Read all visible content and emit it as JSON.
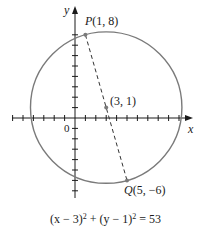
{
  "diagram": {
    "type": "circle-on-coordinate-plane",
    "axes": {
      "x_label": "x",
      "y_label": "y",
      "origin_label": "0",
      "x_ticks": [
        -6,
        -5,
        -4,
        -3,
        -2,
        -1,
        1,
        2,
        3,
        4,
        5,
        6,
        7,
        8,
        9,
        10,
        11
      ],
      "y_ticks": [
        -7,
        -6,
        -5,
        -4,
        -3,
        -2,
        -1,
        1,
        2,
        3,
        4,
        5,
        6,
        7,
        8
      ]
    },
    "circle": {
      "center": [
        3,
        1
      ],
      "radius_squared": 53,
      "stroke_color": "#7a7a7a"
    },
    "points": [
      {
        "name": "P",
        "coords_label": "(1, 8)",
        "x": 1,
        "y": 8
      },
      {
        "name": "center",
        "coords_label": "(3, 1)",
        "x": 3,
        "y": 1
      },
      {
        "name": "Q",
        "coords_label": "(5, −6)",
        "x": 5,
        "y": -6
      }
    ],
    "segment": {
      "from": "P",
      "to": "Q",
      "style": "dashed"
    },
    "equation": {
      "lhs_a": "(x − 3)",
      "exp_a": "2",
      "plus": " + ",
      "lhs_b": "(y − 1)",
      "exp_b": "2",
      "rhs": " = 53"
    }
  },
  "labels": {
    "p_name": "P",
    "p_coords": "(1, 8)",
    "center_coords": "(3, 1)",
    "q_name": "Q",
    "q_coords": "(5, −6)",
    "x_axis": "x",
    "y_axis": "y",
    "origin": "0"
  }
}
